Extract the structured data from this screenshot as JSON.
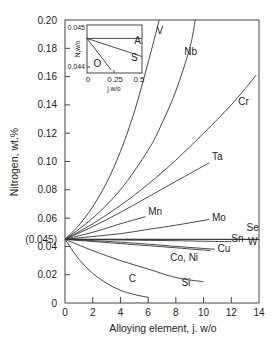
{
  "chart_data": {
    "type": "line",
    "title": "",
    "xlabel": "Alloying element, j. w/o",
    "ylabel": "Nitrogen, wt.%",
    "xlim": [
      0,
      14
    ],
    "ylim": [
      0,
      0.2
    ],
    "xticks": [
      "0",
      "2",
      "4",
      "6",
      "8",
      "10",
      "12",
      "14"
    ],
    "yticks": [
      "0",
      "0.02",
      "0.04",
      "0.06",
      "0.08",
      "0.10",
      "0.12",
      "0.14",
      "0.16",
      "0.18",
      "0.20"
    ],
    "special_ytick": "(0.045)",
    "grid": false,
    "legend": "none (curves labeled directly)",
    "series": [
      {
        "name": "V",
        "x": [
          0,
          1,
          2,
          3,
          4,
          5,
          6,
          6.8
        ],
        "y": [
          0.045,
          0.055,
          0.068,
          0.085,
          0.107,
          0.135,
          0.17,
          0.2
        ],
        "label_at": [
          6.6,
          0.19
        ]
      },
      {
        "name": "Nb",
        "x": [
          0,
          2,
          4,
          6,
          7,
          8,
          9,
          9.4
        ],
        "y": [
          0.045,
          0.06,
          0.08,
          0.108,
          0.127,
          0.15,
          0.18,
          0.2
        ],
        "label_at": [
          8.6,
          0.175
        ]
      },
      {
        "name": "Cr",
        "x": [
          0,
          2,
          4,
          6,
          8,
          10,
          12,
          13.8
        ],
        "y": [
          0.045,
          0.056,
          0.069,
          0.084,
          0.101,
          0.12,
          0.14,
          0.161
        ],
        "label_at": [
          12.5,
          0.14
        ]
      },
      {
        "name": "Ta",
        "x": [
          0,
          2,
          4,
          6,
          8,
          10.4
        ],
        "y": [
          0.045,
          0.054,
          0.064,
          0.075,
          0.086,
          0.099
        ],
        "label_at": [
          10.6,
          0.101
        ]
      },
      {
        "name": "Mn",
        "x": [
          0,
          2,
          4,
          5.8
        ],
        "y": [
          0.045,
          0.05,
          0.056,
          0.061
        ],
        "label_at": [
          6.0,
          0.062
        ]
      },
      {
        "name": "Mo",
        "x": [
          0,
          2,
          4,
          6,
          8,
          10.4
        ],
        "y": [
          0.045,
          0.047,
          0.049,
          0.052,
          0.055,
          0.059
        ],
        "label_at": [
          10.6,
          0.058
        ]
      },
      {
        "name": "Se",
        "x": [
          0,
          14
        ],
        "y": [
          0.045,
          0.045
        ],
        "label_at": [
          13.1,
          0.051
        ]
      },
      {
        "name": "Sn",
        "x": [
          0,
          4,
          8,
          12
        ],
        "y": [
          0.045,
          0.0445,
          0.044,
          0.0433
        ],
        "label_at": [
          12.0,
          0.043
        ]
      },
      {
        "name": "W",
        "x": [
          0,
          14
        ],
        "y": [
          0.045,
          0.0449
        ],
        "label_at": [
          13.2,
          0.041
        ]
      },
      {
        "name": "Cu",
        "x": [
          0,
          4,
          8,
          10.8
        ],
        "y": [
          0.045,
          0.043,
          0.04,
          0.038
        ],
        "label_at": [
          11.0,
          0.036
        ]
      },
      {
        "name": "Co, Ni",
        "x": [
          0,
          4,
          8,
          10.5
        ],
        "y": [
          0.045,
          0.042,
          0.039,
          0.037
        ],
        "label_at": [
          7.6,
          0.03
        ]
      },
      {
        "name": "Si",
        "x": [
          0,
          2,
          4,
          6,
          8,
          10
        ],
        "y": [
          0.045,
          0.037,
          0.03,
          0.024,
          0.018,
          0.015
        ],
        "label_at": [
          8.4,
          0.012
        ]
      },
      {
        "name": "C",
        "x": [
          0,
          1,
          2,
          3,
          4,
          5,
          6
        ],
        "y": [
          0.045,
          0.031,
          0.021,
          0.014,
          0.009,
          0.006,
          0.004
        ],
        "label_at": [
          4.6,
          0.015
        ]
      }
    ],
    "inset": {
      "xlabel": "j.w/o",
      "ylabel": "N,w/o",
      "xlim": [
        0,
        0.5
      ],
      "ylim": [
        0.044,
        0.045
      ],
      "xticks": [
        "0",
        "0.25",
        "0.5"
      ],
      "yticks": [
        "0.044",
        "0.045"
      ],
      "series": [
        {
          "name": "A",
          "x": [
            0,
            0.5
          ],
          "y": [
            0.04468,
            0.04468
          ],
          "label_at": [
            0.43,
            0.04455
          ]
        },
        {
          "name": "S",
          "x": [
            0,
            0.5
          ],
          "y": [
            0.04468,
            0.04425
          ],
          "label_at": [
            0.4,
            0.04415
          ]
        },
        {
          "name": "O",
          "x": [
            0,
            0.22
          ],
          "y": [
            0.04468,
            0.04393
          ],
          "label_at": [
            0.06,
            0.044
          ]
        }
      ]
    }
  }
}
